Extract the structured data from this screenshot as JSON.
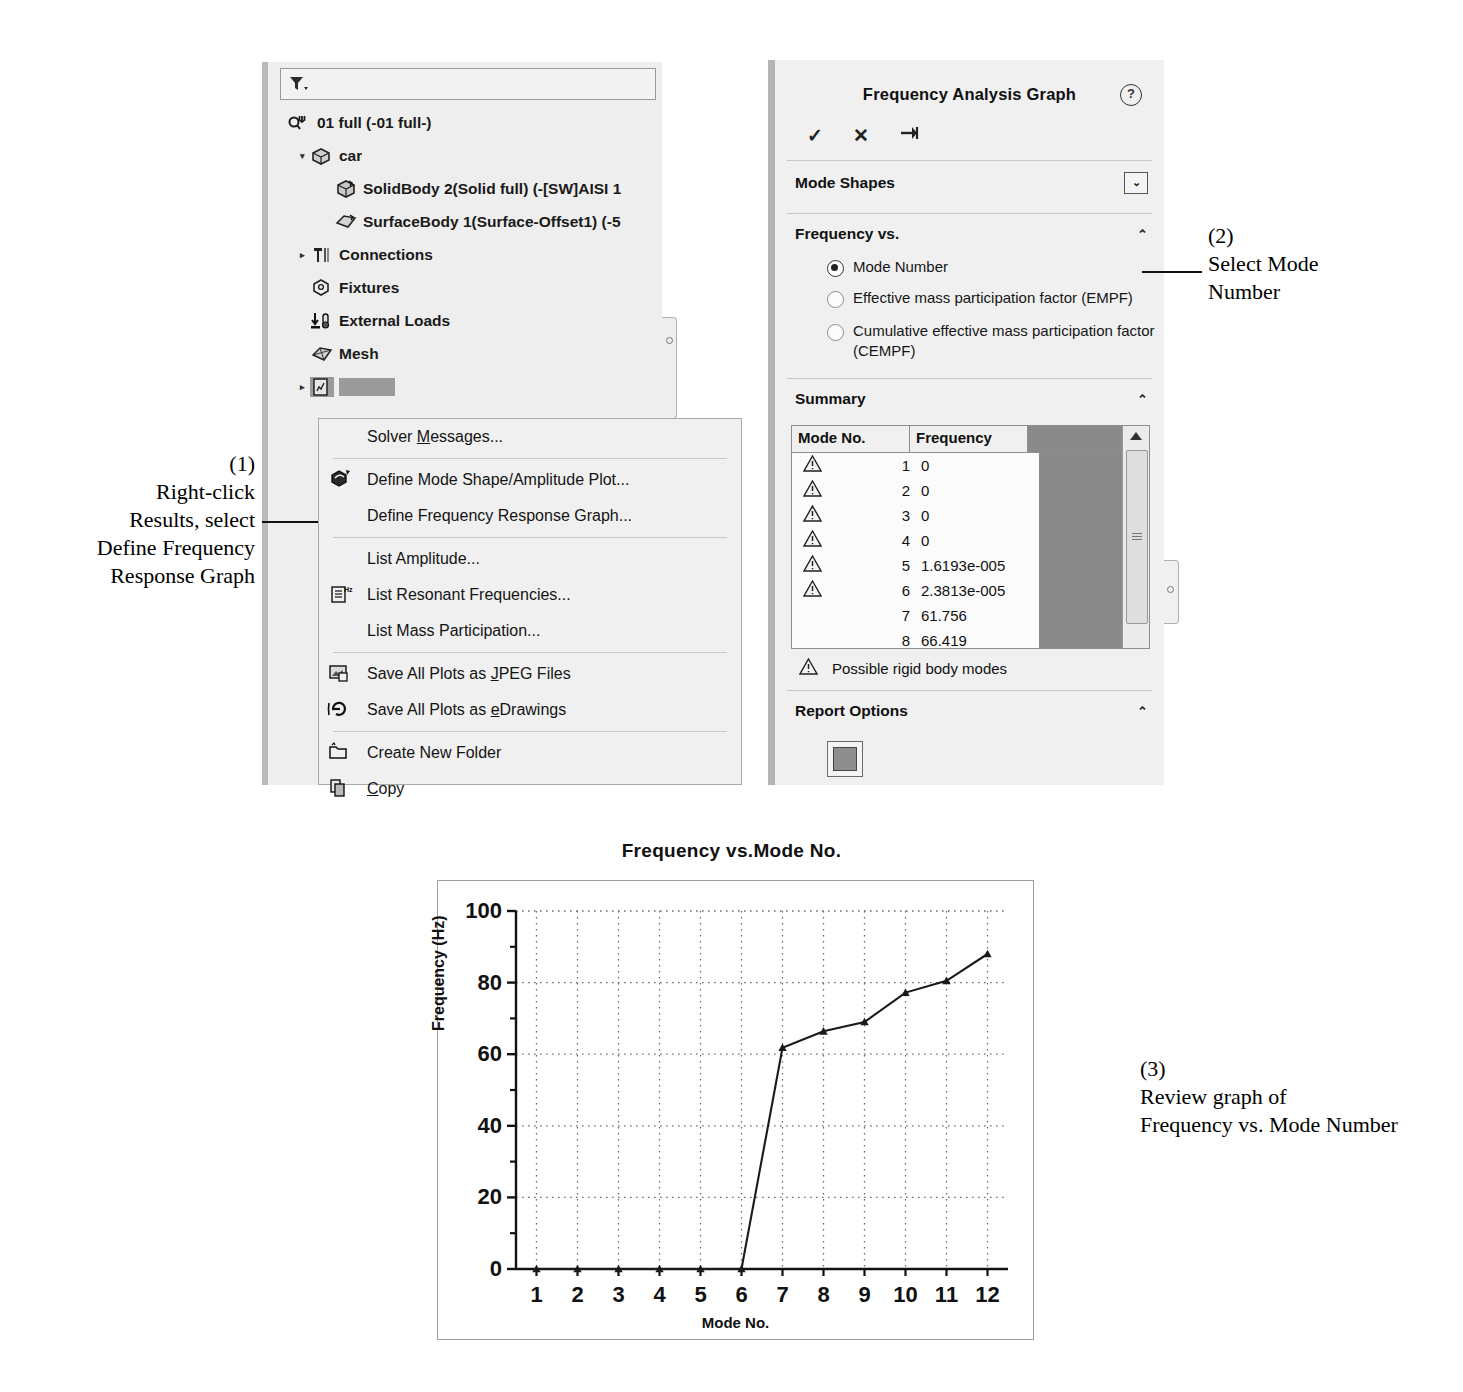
{
  "feature_tree": {
    "filter_icon": "filter-funnel-icon",
    "items": [
      {
        "label": "01 full (-01 full-)",
        "icon": "study-icon",
        "level": 1,
        "arrow": ""
      },
      {
        "label": "car",
        "icon": "part-icon",
        "level": 2,
        "arrow": "▾"
      },
      {
        "label": "SolidBody 2(Solid full) (-[SW]AISI 1",
        "icon": "solid-body-icon",
        "level": 3,
        "arrow": ""
      },
      {
        "label": "SurfaceBody 1(Surface-Offset1) (-5",
        "icon": "surface-body-icon",
        "level": 3,
        "arrow": ""
      },
      {
        "label": "Connections",
        "icon": "connections-icon",
        "level": 2,
        "arrow": "▸"
      },
      {
        "label": "Fixtures",
        "icon": "fixtures-icon",
        "level": 2,
        "arrow": ""
      },
      {
        "label": "External Loads",
        "icon": "external-loads-icon",
        "level": 2,
        "arrow": ""
      },
      {
        "label": "Mesh",
        "icon": "mesh-icon",
        "level": 2,
        "arrow": ""
      },
      {
        "label": "Results",
        "icon": "results-icon",
        "level": 2,
        "arrow": "▸",
        "selected": true
      }
    ]
  },
  "context_menu": {
    "groups": [
      [
        {
          "label": "Solver Messages...",
          "icon": "",
          "accel": "M"
        }
      ],
      [
        {
          "label": "Define Mode Shape/Amplitude Plot...",
          "icon": "mode-shape-plot-icon",
          "accel": ""
        },
        {
          "label": "Define Frequency Response Graph...",
          "icon": "",
          "accel": ""
        }
      ],
      [
        {
          "label": "List Amplitude...",
          "icon": "",
          "accel": ""
        },
        {
          "label": "List Resonant Frequencies...",
          "icon": "list-frequencies-icon",
          "accel": ""
        },
        {
          "label": "List Mass Participation...",
          "icon": "",
          "accel": ""
        }
      ],
      [
        {
          "label": "Save All Plots as JPEG Files",
          "icon": "save-jpeg-icon",
          "accel": "J"
        },
        {
          "label": "Save All Plots as eDrawings",
          "icon": "edrawings-icon",
          "accel": "e"
        }
      ],
      [
        {
          "label": "Create New Folder",
          "icon": "new-folder-icon",
          "accel": ""
        },
        {
          "label": "Copy",
          "icon": "copy-icon",
          "accel": "C"
        }
      ]
    ]
  },
  "property_manager": {
    "title": "Frequency Analysis Graph",
    "help_glyph": "?",
    "actions": [
      {
        "name": "ok-check",
        "glyph": "✓"
      },
      {
        "name": "cancel-x",
        "glyph": "✕"
      },
      {
        "name": "pin",
        "glyph": "➔"
      }
    ],
    "sections": {
      "mode_shapes": {
        "title": "Mode Shapes",
        "control": "⌄"
      },
      "frequency_vs": {
        "title": "Frequency vs.",
        "chevron": "⌃",
        "options": [
          {
            "label": "Mode Number",
            "selected": true
          },
          {
            "label": "Effective mass participation factor (EMPF)",
            "selected": false
          },
          {
            "label": "Cumulative effective mass participation factor (CEMPF)",
            "selected": false
          }
        ]
      },
      "summary": {
        "title": "Summary",
        "chevron": "⌃",
        "columns": [
          "Mode No.",
          "Frequency"
        ],
        "rows": [
          {
            "warn": true,
            "mode": "1",
            "freq": "0"
          },
          {
            "warn": true,
            "mode": "2",
            "freq": "0"
          },
          {
            "warn": true,
            "mode": "3",
            "freq": "0"
          },
          {
            "warn": true,
            "mode": "4",
            "freq": "0"
          },
          {
            "warn": true,
            "mode": "5",
            "freq": "1.6193e-005"
          },
          {
            "warn": true,
            "mode": "6",
            "freq": "2.3813e-005"
          },
          {
            "warn": false,
            "mode": "7",
            "freq": "61.756"
          },
          {
            "warn": false,
            "mode": "8",
            "freq": "66.419"
          },
          {
            "warn": false,
            "mode": "10",
            "freq": "77.196"
          }
        ],
        "legend": "Possible rigid body modes"
      },
      "report_options": {
        "title": "Report Options",
        "chevron": "⌃",
        "button": "save-report-icon"
      }
    }
  },
  "chart_data": {
    "type": "line",
    "title": "Frequency vs.Mode No.",
    "xlabel": "Mode No.",
    "ylabel": "Frequency (Hz)",
    "x": [
      1,
      2,
      3,
      4,
      5,
      6,
      7,
      8,
      9,
      10,
      11,
      12
    ],
    "xticklabels": [
      "1",
      "2",
      "3",
      "4",
      "5",
      "6",
      "7",
      "8",
      "9",
      "10",
      "11",
      "12"
    ],
    "values": [
      0,
      0,
      0,
      0,
      0,
      0,
      61.8,
      66.4,
      69.0,
      77.2,
      80.5,
      88.0
    ],
    "yticklabels": [
      "0",
      "20",
      "40",
      "60",
      "80",
      "100"
    ],
    "yticks": [
      0,
      20,
      40,
      60,
      80,
      100
    ],
    "yminorticks": [
      10,
      30,
      50,
      70,
      90
    ],
    "ylim": [
      0,
      100
    ],
    "xlim": [
      0.5,
      12.5
    ],
    "grid": true,
    "legend": "none",
    "marker": "triangle",
    "line_color": "#1a1a1a"
  },
  "annotations": [
    {
      "num": "(1)",
      "text": "Right-click\nResults, select\nDefine Frequency\nResponse Graph"
    },
    {
      "num": "(2)",
      "text": "Select Mode\nNumber"
    },
    {
      "num": "(3)",
      "text": "Review graph of\nFrequency vs. Mode Number"
    }
  ]
}
